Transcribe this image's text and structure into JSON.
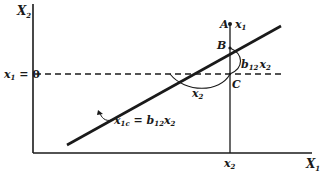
{
  "diagram": {
    "axes": {
      "y_label": "X",
      "y_label_sub": "2",
      "x_label": "X",
      "x_label_sub": "1"
    },
    "reference_line": {
      "label_var": "x",
      "label_sub": "1",
      "label_rest": " = 0"
    },
    "points": {
      "A": "A",
      "A_label_var": "x",
      "A_label_sub": "1",
      "B": "B",
      "C": "C"
    },
    "x_tick": {
      "var": "x",
      "sub": "2"
    },
    "segment_labels": {
      "horizontal_var": "x",
      "horizontal_sub": "2",
      "vertical_coef": "b",
      "vertical_coef_sub": "12",
      "vertical_var": "x",
      "vertical_var_sub": "2"
    },
    "regression_line": {
      "lhs_var": "x",
      "lhs_sub": "1c",
      "eq": " = ",
      "coef": "b",
      "coef_sub": "12",
      "rhs_var": "x",
      "rhs_sub": "2"
    },
    "colors": {
      "ink": "#1a1a1a",
      "background": "#ffffff"
    }
  }
}
